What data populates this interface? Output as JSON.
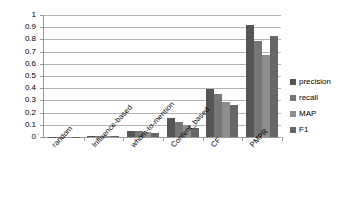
{
  "chart_data": {
    "type": "bar",
    "title": "",
    "xlabel": "",
    "ylabel": "",
    "ylim": [
      0,
      1
    ],
    "ytick_values": [
      "1",
      "0.9",
      "0.8",
      "0.7",
      "0.6",
      "0.5",
      "0.4",
      "0.3",
      "0.2",
      "0.1",
      "0"
    ],
    "grid": true,
    "legend_position": "right",
    "categories": [
      "random",
      "Influence-based",
      "whom-to-mention",
      "Content_based",
      "CF",
      "PMPR"
    ],
    "series": [
      {
        "name": "precision",
        "color": "#555555",
        "values": [
          0.004,
          0.012,
          0.05,
          0.155,
          0.39,
          0.92
        ]
      },
      {
        "name": "recall",
        "color": "#767676",
        "values": [
          0.003,
          0.01,
          0.047,
          0.125,
          0.35,
          0.79
        ]
      },
      {
        "name": "MAP",
        "color": "#8d8d8d",
        "values": [
          0.003,
          0.009,
          0.04,
          0.095,
          0.285,
          0.67
        ]
      },
      {
        "name": "F1",
        "color": "#666666",
        "values": [
          0.002,
          0.008,
          0.035,
          0.075,
          0.26,
          0.83
        ]
      }
    ]
  }
}
